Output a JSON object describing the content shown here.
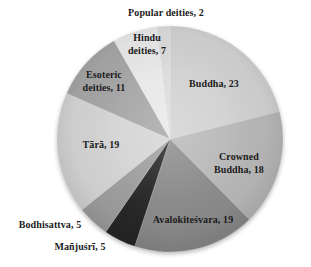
{
  "chart_data": {
    "type": "pie",
    "title": "",
    "categories": [
      "Buddha",
      "Crowned Buddha",
      "Avalokiteśvara",
      "Mañjuśrī",
      "Bodhisattva",
      "Tārā",
      "Esoteric deities",
      "Hindu deities",
      "Popular deities"
    ],
    "values": [
      23,
      18,
      19,
      5,
      5,
      19,
      11,
      7,
      2
    ],
    "colors": [
      "#d1d1d1",
      "#b8b8b8",
      "#8b8b8b",
      "#272727",
      "#9e9e9e",
      "#d4d4d4",
      "#a5a5a5",
      "#e8e8e8",
      "#dbdbdb"
    ],
    "start_angle_deg": 0,
    "direction": "clockwise",
    "legend_position": "none",
    "data_labels": "category-and-value"
  },
  "labels": {
    "popular": "Popular deities, 2",
    "hindu": "Hindu\ndeities, 7",
    "esoteric": "Esoteric\ndeities, 11",
    "buddha": "Buddha, 23",
    "tara": "Tārā, 19",
    "crowned_buddha": "Crowned Buddha, 18",
    "avalokitesvara": "Avalokiteśvara, 19",
    "bodhisattva": "Bodhisattva, 5",
    "manjusri": "Mañjuśrī, 5"
  }
}
